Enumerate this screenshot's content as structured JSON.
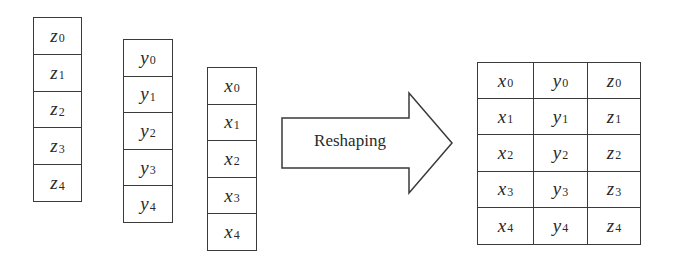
{
  "diagram": {
    "columns": [
      {
        "name": "z",
        "cells": [
          {
            "var": "z",
            "sub": "0"
          },
          {
            "var": "z",
            "sub": "1"
          },
          {
            "var": "z",
            "sub": "2"
          },
          {
            "var": "z",
            "sub": "3"
          },
          {
            "var": "z",
            "sub": "4"
          }
        ]
      },
      {
        "name": "y",
        "cells": [
          {
            "var": "y",
            "sub": "0"
          },
          {
            "var": "y",
            "sub": "1"
          },
          {
            "var": "y",
            "sub": "2"
          },
          {
            "var": "y",
            "sub": "3"
          },
          {
            "var": "y",
            "sub": "4"
          }
        ]
      },
      {
        "name": "x",
        "cells": [
          {
            "var": "x",
            "sub": "0"
          },
          {
            "var": "x",
            "sub": "1"
          },
          {
            "var": "x",
            "sub": "2"
          },
          {
            "var": "x",
            "sub": "3"
          },
          {
            "var": "x",
            "sub": "4"
          }
        ]
      }
    ],
    "arrow": {
      "label": "Reshaping"
    },
    "matrix": {
      "rows": [
        [
          {
            "var": "x",
            "sub": "0"
          },
          {
            "var": "y",
            "sub": "0"
          },
          {
            "var": "z",
            "sub": "0"
          }
        ],
        [
          {
            "var": "x",
            "sub": "1"
          },
          {
            "var": "y",
            "sub": "1"
          },
          {
            "var": "z",
            "sub": "1"
          }
        ],
        [
          {
            "var": "x",
            "sub": "2"
          },
          {
            "var": "y",
            "sub": "2"
          },
          {
            "var": "z",
            "sub": "2"
          }
        ],
        [
          {
            "var": "x",
            "sub": "3"
          },
          {
            "var": "y",
            "sub": "3"
          },
          {
            "var": "z",
            "sub": "3"
          }
        ],
        [
          {
            "var": "x",
            "sub": "4"
          },
          {
            "var": "y",
            "sub": "4"
          },
          {
            "var": "z",
            "sub": "4"
          }
        ]
      ]
    },
    "colors": {
      "stroke": "#3a3a3a",
      "text": "#2a2a2a",
      "background": "#ffffff"
    }
  }
}
